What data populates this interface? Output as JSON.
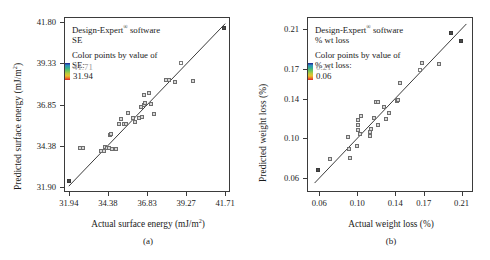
{
  "figure": {
    "panels": [
      {
        "key": "a",
        "caption": "(a)",
        "legend": {
          "line1_pre": "Design-Expert",
          "line1_sup": "®",
          "line1_post": " software",
          "line2": "SE",
          "line3": "Color points by value of",
          "line4": "SE:",
          "scale_high": "41.71",
          "scale_low": "31.94"
        },
        "chart_data": {
          "type": "scatter",
          "title": "",
          "xlabel_pre": "Actual surface energy (mJ/m",
          "xlabel_sup": "2",
          "xlabel_post": ")",
          "ylabel_pre": "Predicted surface energy (mJ/m",
          "ylabel_sup": "2",
          "ylabel_post": ")",
          "xticks": [
            "31.94",
            "34.38",
            "36.83",
            "39.27",
            "41.71"
          ],
          "yticks": [
            "31.90",
            "34.38",
            "36.85",
            "39.33",
            "41.80"
          ],
          "xlim": [
            31.64,
            42.01
          ],
          "ylim": [
            31.59,
            42.11
          ],
          "grid": false,
          "legend_position": "inside-top-left",
          "fitline": {
            "x0": 31.94,
            "y0": 31.94,
            "x1": 41.71,
            "y1": 41.71
          },
          "points": [
            {
              "x": 31.94,
              "y": 32.25,
              "style": "filled"
            },
            {
              "x": 32.62,
              "y": 34.22,
              "style": "semi"
            },
            {
              "x": 32.8,
              "y": 34.22,
              "style": "semi"
            },
            {
              "x": 33.95,
              "y": 34.05,
              "style": "semi"
            },
            {
              "x": 34.12,
              "y": 34.08,
              "style": "semi"
            },
            {
              "x": 34.22,
              "y": 34.3,
              "style": "semi"
            },
            {
              "x": 34.3,
              "y": 34.22,
              "style": "semi"
            },
            {
              "x": 34.44,
              "y": 34.24,
              "style": "semi"
            },
            {
              "x": 34.66,
              "y": 34.18,
              "style": "semi"
            },
            {
              "x": 34.88,
              "y": 34.2,
              "style": "semi"
            },
            {
              "x": 34.52,
              "y": 35.0,
              "style": "semi"
            },
            {
              "x": 34.6,
              "y": 35.08,
              "style": "semi"
            },
            {
              "x": 35.05,
              "y": 35.68,
              "style": "semi"
            },
            {
              "x": 35.4,
              "y": 35.66,
              "style": "semi"
            },
            {
              "x": 35.52,
              "y": 35.7,
              "style": "semi"
            },
            {
              "x": 35.2,
              "y": 35.95,
              "style": "semi"
            },
            {
              "x": 35.62,
              "y": 36.35,
              "style": "semi"
            },
            {
              "x": 35.95,
              "y": 36.05,
              "style": "semi"
            },
            {
              "x": 36.1,
              "y": 35.82,
              "style": "semi"
            },
            {
              "x": 36.35,
              "y": 36.06,
              "style": "semi"
            },
            {
              "x": 36.52,
              "y": 36.08,
              "style": "semi"
            },
            {
              "x": 36.48,
              "y": 36.72,
              "style": "semi"
            },
            {
              "x": 36.66,
              "y": 36.8,
              "style": "semi"
            },
            {
              "x": 36.7,
              "y": 36.92,
              "style": "semi"
            },
            {
              "x": 36.62,
              "y": 37.42,
              "style": "semi"
            },
            {
              "x": 36.98,
              "y": 37.52,
              "style": "semi"
            },
            {
              "x": 37.05,
              "y": 36.88,
              "style": "semi"
            },
            {
              "x": 37.28,
              "y": 36.28,
              "style": "semi"
            },
            {
              "x": 38.02,
              "y": 38.34,
              "style": "semi"
            },
            {
              "x": 38.2,
              "y": 38.34,
              "style": "semi"
            },
            {
              "x": 38.58,
              "y": 38.22,
              "style": "semi"
            },
            {
              "x": 38.95,
              "y": 39.33,
              "style": "open"
            },
            {
              "x": 39.7,
              "y": 38.28,
              "style": "semi"
            },
            {
              "x": 41.65,
              "y": 41.42,
              "style": "filled"
            }
          ]
        }
      },
      {
        "key": "b",
        "caption": "(b)",
        "legend": {
          "line1_pre": "Design-Expert",
          "line1_sup": "®",
          "line1_post": " software",
          "line2": "% wt loss",
          "line3": "Color points by value of",
          "line4": "% wt loss:",
          "scale_high": "0.21",
          "scale_low": "0.06"
        },
        "chart_data": {
          "type": "scatter",
          "title": "",
          "xlabel_pre": "Actual weight loss (%)",
          "xlabel_sup": "",
          "xlabel_post": "",
          "ylabel_pre": "Predicted weight loss (%)",
          "ylabel_sup": "",
          "ylabel_post": "",
          "xticks": [
            "0.06",
            "0.10",
            "0.14",
            "0.17",
            "0.21"
          ],
          "yticks": [
            "0.06",
            "0.10",
            "0.14",
            "0.17",
            "0.21"
          ],
          "xlim": [
            0.047,
            0.222
          ],
          "ylim": [
            0.046,
            0.222
          ],
          "grid": false,
          "legend_position": "inside-top-left",
          "fitline": {
            "x0": 0.055,
            "y0": 0.055,
            "x1": 0.215,
            "y1": 0.215
          },
          "points": [
            {
              "x": 0.059,
              "y": 0.068,
              "style": "filled"
            },
            {
              "x": 0.071,
              "y": 0.079,
              "style": "semi"
            },
            {
              "x": 0.09,
              "y": 0.101,
              "style": "semi"
            },
            {
              "x": 0.091,
              "y": 0.089,
              "style": "semi"
            },
            {
              "x": 0.092,
              "y": 0.08,
              "style": "semi"
            },
            {
              "x": 0.1,
              "y": 0.092,
              "style": "semi"
            },
            {
              "x": 0.101,
              "y": 0.113,
              "style": "semi"
            },
            {
              "x": 0.101,
              "y": 0.118,
              "style": "semi"
            },
            {
              "x": 0.101,
              "y": 0.108,
              "style": "semi"
            },
            {
              "x": 0.103,
              "y": 0.104,
              "style": "semi"
            },
            {
              "x": 0.113,
              "y": 0.102,
              "style": "semi"
            },
            {
              "x": 0.113,
              "y": 0.106,
              "style": "semi"
            },
            {
              "x": 0.114,
              "y": 0.109,
              "style": "semi"
            },
            {
              "x": 0.104,
              "y": 0.122,
              "style": "semi"
            },
            {
              "x": 0.118,
              "y": 0.12,
              "style": "semi"
            },
            {
              "x": 0.12,
              "y": 0.137,
              "style": "semi"
            },
            {
              "x": 0.122,
              "y": 0.137,
              "style": "semi"
            },
            {
              "x": 0.122,
              "y": 0.113,
              "style": "semi"
            },
            {
              "x": 0.128,
              "y": 0.131,
              "style": "semi"
            },
            {
              "x": 0.13,
              "y": 0.119,
              "style": "semi"
            },
            {
              "x": 0.133,
              "y": 0.125,
              "style": "semi"
            },
            {
              "x": 0.142,
              "y": 0.138,
              "style": "semi"
            },
            {
              "x": 0.143,
              "y": 0.139,
              "style": "semi"
            },
            {
              "x": 0.145,
              "y": 0.156,
              "style": "semi"
            },
            {
              "x": 0.166,
              "y": 0.169,
              "style": "open"
            },
            {
              "x": 0.168,
              "y": 0.176,
              "style": "semi"
            },
            {
              "x": 0.186,
              "y": 0.175,
              "style": "semi"
            },
            {
              "x": 0.199,
              "y": 0.206,
              "style": "filled"
            },
            {
              "x": 0.209,
              "y": 0.198,
              "style": "filled"
            }
          ]
        }
      }
    ]
  }
}
